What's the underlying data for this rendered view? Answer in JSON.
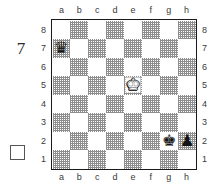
{
  "diagram": {
    "type": "chess-position",
    "move_number_label": "7",
    "side_to_move_indicator": "white-empty-square",
    "board": {
      "orientation": "white-bottom",
      "files": [
        "a",
        "b",
        "c",
        "d",
        "e",
        "f",
        "g",
        "h"
      ],
      "ranks": [
        "8",
        "7",
        "6",
        "5",
        "4",
        "3",
        "2",
        "1"
      ],
      "light_square_color": "#ffffff",
      "dark_square_color": "#8e8e8e",
      "border_color": "#1a1a1a"
    },
    "pieces": [
      {
        "square": "a7",
        "color": "black",
        "type": "queen",
        "glyph": "♛"
      },
      {
        "square": "e5",
        "color": "white",
        "type": "king",
        "glyph": "♚"
      },
      {
        "square": "g2",
        "color": "black",
        "type": "king",
        "glyph": "♚"
      },
      {
        "square": "h2",
        "color": "black",
        "type": "pawn",
        "glyph": "♟"
      }
    ],
    "squares": [
      [
        {
          "f": "a",
          "r": "8",
          "s": "light",
          "p": null
        },
        {
          "f": "b",
          "r": "8",
          "s": "dark",
          "p": null
        },
        {
          "f": "c",
          "r": "8",
          "s": "light",
          "p": null
        },
        {
          "f": "d",
          "r": "8",
          "s": "dark",
          "p": null
        },
        {
          "f": "e",
          "r": "8",
          "s": "light",
          "p": null
        },
        {
          "f": "f",
          "r": "8",
          "s": "dark",
          "p": null
        },
        {
          "f": "g",
          "r": "8",
          "s": "light",
          "p": null
        },
        {
          "f": "h",
          "r": "8",
          "s": "dark",
          "p": null
        }
      ],
      [
        {
          "f": "a",
          "r": "7",
          "s": "dark",
          "p": 0
        },
        {
          "f": "b",
          "r": "7",
          "s": "light",
          "p": null
        },
        {
          "f": "c",
          "r": "7",
          "s": "dark",
          "p": null
        },
        {
          "f": "d",
          "r": "7",
          "s": "light",
          "p": null
        },
        {
          "f": "e",
          "r": "7",
          "s": "dark",
          "p": null
        },
        {
          "f": "f",
          "r": "7",
          "s": "light",
          "p": null
        },
        {
          "f": "g",
          "r": "7",
          "s": "dark",
          "p": null
        },
        {
          "f": "h",
          "r": "7",
          "s": "light",
          "p": null
        }
      ],
      [
        {
          "f": "a",
          "r": "6",
          "s": "light",
          "p": null
        },
        {
          "f": "b",
          "r": "6",
          "s": "dark",
          "p": null
        },
        {
          "f": "c",
          "r": "6",
          "s": "light",
          "p": null
        },
        {
          "f": "d",
          "r": "6",
          "s": "dark",
          "p": null
        },
        {
          "f": "e",
          "r": "6",
          "s": "light",
          "p": null
        },
        {
          "f": "f",
          "r": "6",
          "s": "dark",
          "p": null
        },
        {
          "f": "g",
          "r": "6",
          "s": "light",
          "p": null
        },
        {
          "f": "h",
          "r": "6",
          "s": "dark",
          "p": null
        }
      ],
      [
        {
          "f": "a",
          "r": "5",
          "s": "dark",
          "p": null
        },
        {
          "f": "b",
          "r": "5",
          "s": "light",
          "p": null
        },
        {
          "f": "c",
          "r": "5",
          "s": "dark",
          "p": null
        },
        {
          "f": "d",
          "r": "5",
          "s": "light",
          "p": null
        },
        {
          "f": "e",
          "r": "5",
          "s": "dark",
          "p": 1
        },
        {
          "f": "f",
          "r": "5",
          "s": "light",
          "p": null
        },
        {
          "f": "g",
          "r": "5",
          "s": "dark",
          "p": null
        },
        {
          "f": "h",
          "r": "5",
          "s": "light",
          "p": null
        }
      ],
      [
        {
          "f": "a",
          "r": "4",
          "s": "light",
          "p": null
        },
        {
          "f": "b",
          "r": "4",
          "s": "dark",
          "p": null
        },
        {
          "f": "c",
          "r": "4",
          "s": "light",
          "p": null
        },
        {
          "f": "d",
          "r": "4",
          "s": "dark",
          "p": null
        },
        {
          "f": "e",
          "r": "4",
          "s": "light",
          "p": null
        },
        {
          "f": "f",
          "r": "4",
          "s": "dark",
          "p": null
        },
        {
          "f": "g",
          "r": "4",
          "s": "light",
          "p": null
        },
        {
          "f": "h",
          "r": "4",
          "s": "dark",
          "p": null
        }
      ],
      [
        {
          "f": "a",
          "r": "3",
          "s": "dark",
          "p": null
        },
        {
          "f": "b",
          "r": "3",
          "s": "light",
          "p": null
        },
        {
          "f": "c",
          "r": "3",
          "s": "dark",
          "p": null
        },
        {
          "f": "d",
          "r": "3",
          "s": "light",
          "p": null
        },
        {
          "f": "e",
          "r": "3",
          "s": "dark",
          "p": null
        },
        {
          "f": "f",
          "r": "3",
          "s": "light",
          "p": null
        },
        {
          "f": "g",
          "r": "3",
          "s": "dark",
          "p": null
        },
        {
          "f": "h",
          "r": "3",
          "s": "light",
          "p": null
        }
      ],
      [
        {
          "f": "a",
          "r": "2",
          "s": "light",
          "p": null
        },
        {
          "f": "b",
          "r": "2",
          "s": "dark",
          "p": null
        },
        {
          "f": "c",
          "r": "2",
          "s": "light",
          "p": null
        },
        {
          "f": "d",
          "r": "2",
          "s": "dark",
          "p": null
        },
        {
          "f": "e",
          "r": "2",
          "s": "light",
          "p": null
        },
        {
          "f": "f",
          "r": "2",
          "s": "dark",
          "p": null
        },
        {
          "f": "g",
          "r": "2",
          "s": "light",
          "p": 2
        },
        {
          "f": "h",
          "r": "2",
          "s": "dark",
          "p": 3
        }
      ],
      [
        {
          "f": "a",
          "r": "1",
          "s": "dark",
          "p": null
        },
        {
          "f": "b",
          "r": "1",
          "s": "light",
          "p": null
        },
        {
          "f": "c",
          "r": "1",
          "s": "dark",
          "p": null
        },
        {
          "f": "d",
          "r": "1",
          "s": "light",
          "p": null
        },
        {
          "f": "e",
          "r": "1",
          "s": "dark",
          "p": null
        },
        {
          "f": "f",
          "r": "1",
          "s": "light",
          "p": null
        },
        {
          "f": "g",
          "r": "1",
          "s": "dark",
          "p": null
        },
        {
          "f": "h",
          "r": "1",
          "s": "light",
          "p": null
        }
      ]
    ]
  }
}
